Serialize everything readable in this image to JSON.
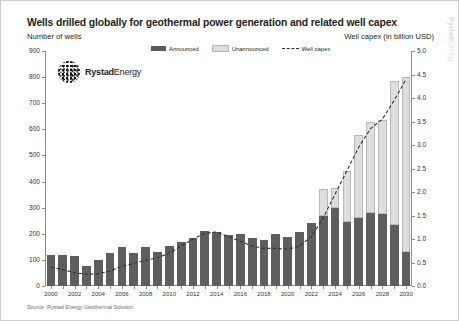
{
  "header": {
    "title": "Wells drilled globally for geothermal power generation and related well capex",
    "subtitle_left": "Number of wells",
    "subtitle_right": "Well capex (in billion USD)",
    "watermark_bold": "Rystad",
    "watermark_light": "Energy"
  },
  "logo": {
    "name_bold": "Rystad",
    "name_light": "Energy",
    "mark": "sphere-dots-icon"
  },
  "legend": [
    {
      "label": "Announced",
      "swatch": "ann",
      "color": "#5a5a5a"
    },
    {
      "label": "Unannounced",
      "swatch": "unann",
      "color": "#dedede"
    },
    {
      "label": "Well capex",
      "swatch": "line",
      "color": "#333333"
    }
  ],
  "footer": {
    "source": "Source: Rystad Energy Geothermal Solution"
  },
  "chart_data": {
    "type": "bar",
    "title": "Wells drilled globally for geothermal power generation and related well capex",
    "xlabel": "",
    "ylabel": "Number of wells",
    "y2label": "Well capex (in billion USD)",
    "ylim": [
      0,
      900
    ],
    "y2lim": [
      0,
      5.0
    ],
    "yticks": [
      0,
      100,
      200,
      300,
      400,
      500,
      600,
      700,
      800,
      900
    ],
    "y2ticks": [
      "0.0",
      "0.5",
      "1.0",
      "1.5",
      "2.0",
      "2.5",
      "3.0",
      "3.5",
      "4.0",
      "4.5",
      "5.0"
    ],
    "grid": false,
    "legend_position": "top-center",
    "categories": [
      2000,
      2001,
      2002,
      2003,
      2004,
      2005,
      2006,
      2007,
      2008,
      2009,
      2010,
      2011,
      2012,
      2013,
      2014,
      2015,
      2016,
      2017,
      2018,
      2019,
      2020,
      2021,
      2022,
      2023,
      2024,
      2025,
      2026,
      2027,
      2028,
      2029,
      2030
    ],
    "xtick_labels": [
      2000,
      2002,
      2004,
      2006,
      2008,
      2010,
      2012,
      2014,
      2016,
      2018,
      2020,
      2022,
      2024,
      2026,
      2028,
      2030
    ],
    "series": [
      {
        "name": "Announced",
        "stack": "wells",
        "color": "#5e5e5e",
        "values": [
          118,
          120,
          115,
          78,
          100,
          128,
          148,
          125,
          148,
          130,
          152,
          168,
          185,
          210,
          208,
          195,
          200,
          183,
          175,
          200,
          188,
          205,
          240,
          270,
          300,
          245,
          260,
          280,
          275,
          235,
          130
        ]
      },
      {
        "name": "Unannounced",
        "stack": "wells",
        "color": "#dedede",
        "values": [
          0,
          0,
          0,
          0,
          0,
          0,
          0,
          0,
          0,
          0,
          0,
          0,
          0,
          0,
          0,
          0,
          0,
          0,
          0,
          0,
          0,
          0,
          0,
          100,
          75,
          195,
          320,
          350,
          360,
          550,
          670
        ]
      }
    ],
    "totals": [
      118,
      120,
      115,
      78,
      100,
      128,
      148,
      125,
      148,
      130,
      152,
      168,
      185,
      210,
      208,
      195,
      200,
      183,
      175,
      200,
      188,
      205,
      240,
      370,
      375,
      440,
      580,
      630,
      635,
      785,
      800
    ],
    "line_series": {
      "name": "Well capex",
      "axis": "y2",
      "color": "#333333",
      "style": "dashed",
      "values": [
        0.4,
        0.35,
        0.28,
        0.25,
        0.26,
        0.32,
        0.42,
        0.48,
        0.55,
        0.6,
        0.7,
        0.85,
        1.0,
        1.12,
        1.15,
        1.05,
        0.95,
        0.85,
        0.8,
        0.8,
        0.78,
        0.85,
        1.05,
        1.45,
        1.95,
        2.45,
        2.95,
        3.35,
        3.55,
        3.95,
        4.4
      ]
    }
  }
}
